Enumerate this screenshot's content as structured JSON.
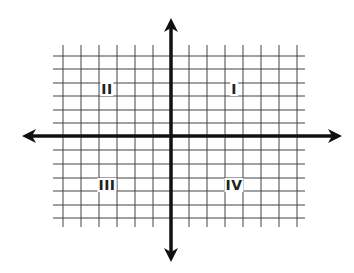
{
  "diagram": {
    "title": "",
    "type": "cartesian-coordinate-plane",
    "colors": {
      "background": "#ffffff",
      "grid": "#444444",
      "axes": "#111111",
      "labels": "#222222"
    },
    "grid": {
      "vertical_lines_x": [
        63,
        81,
        99,
        117,
        135,
        153,
        189,
        207,
        225,
        243,
        261,
        279,
        297
      ],
      "horizontal_lines_y": [
        56,
        69,
        83,
        96,
        110,
        123,
        150,
        164,
        178,
        191,
        205,
        218
      ],
      "x_extent": [
        53,
        305
      ],
      "y_extent": [
        45,
        227
      ]
    },
    "axes": {
      "x_axis": {
        "y": 136,
        "from_x": 22,
        "to_x": 342,
        "arrows": [
          "left",
          "right"
        ]
      },
      "y_axis": {
        "x": 171,
        "from_y": 18,
        "to_y": 262,
        "arrows": [
          "up",
          "down"
        ]
      }
    },
    "quadrants": [
      {
        "id": "q1",
        "label": "I",
        "x": 234,
        "y": 89
      },
      {
        "id": "q2",
        "label": "II",
        "x": 107,
        "y": 89
      },
      {
        "id": "q3",
        "label": "III",
        "x": 107,
        "y": 185
      },
      {
        "id": "q4",
        "label": "IV",
        "x": 234,
        "y": 185
      }
    ]
  }
}
